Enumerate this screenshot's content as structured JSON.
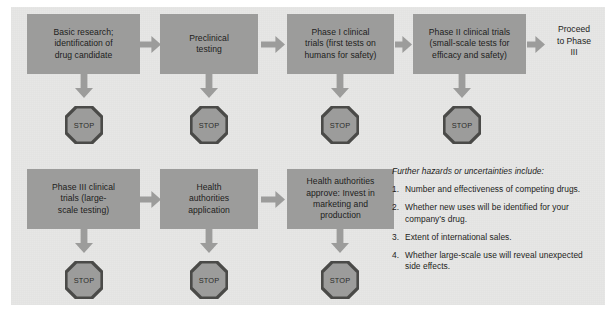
{
  "panel": {
    "background_color": "#e7e7e6",
    "box_color": "#9c9c9b",
    "text_color": "#1d1d1b"
  },
  "flow": {
    "top_row": [
      {
        "id": "basic-research",
        "label": "Basic research;\nidentification of\ndrug candidate"
      },
      {
        "id": "preclinical-testing",
        "label": "Preclinical\ntesting"
      },
      {
        "id": "phase-1",
        "label": "Phase I clinical\ntrials (first tests on\nhumans for safety)"
      },
      {
        "id": "phase-2",
        "label": "Phase II clinical trials\n(small-scale tests for\nefficacy and safety)"
      }
    ],
    "top_end_label": "Proceed\nto Phase\nIII",
    "bottom_row": [
      {
        "id": "phase-3",
        "label": "Phase III clinical\ntrials (large-\nscale testing)"
      },
      {
        "id": "health-authorities-application",
        "label": "Health\nauthorities\napplication"
      },
      {
        "id": "health-authorities-approve",
        "label": "Health authorities\napprove: Invest in\nmarketing and\nproduction"
      }
    ],
    "stop_label": "STOP",
    "stop_count_top": 4,
    "stop_count_bottom": 3
  },
  "notes": {
    "heading": "Further hazards or uncertainties include:",
    "items": [
      {
        "number": "1.",
        "text": "Number and effectiveness of competing drugs."
      },
      {
        "number": "2.",
        "text": "Whether new uses will be identified for your company’s drug."
      },
      {
        "number": "3.",
        "text": "Extent of international sales."
      },
      {
        "number": "4.",
        "text": "Whether large-scale use will reveal unexpected side effects."
      }
    ]
  }
}
